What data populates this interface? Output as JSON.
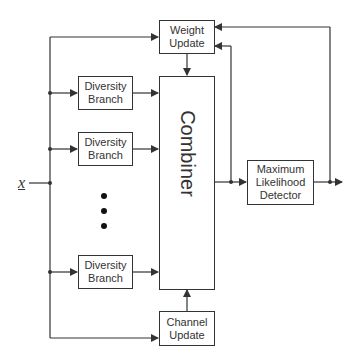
{
  "diagram": {
    "input_label": "x",
    "blocks": {
      "weight_update": [
        "Weight",
        "Update"
      ],
      "diversity_branch_1": [
        "Diversity",
        "Branch"
      ],
      "diversity_branch_2": [
        "Diversity",
        "Branch"
      ],
      "diversity_branch_3": [
        "Diversity",
        "Branch"
      ],
      "combiner": "Combiner",
      "channel_update": [
        "Channel",
        "Update"
      ],
      "ml_detector": [
        "Maximum",
        "Likelihood",
        "Detector"
      ]
    },
    "ellipsis": "vertical-dots",
    "colors": {
      "line": "#333333",
      "background": "#ffffff"
    }
  }
}
